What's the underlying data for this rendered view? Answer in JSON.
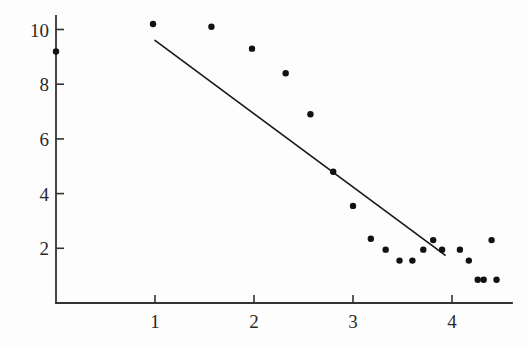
{
  "chart_data": {
    "type": "scatter",
    "title": "",
    "subtitle": "",
    "xlabel": "",
    "ylabel": "",
    "xlim": [
      -0.57,
      4.61
    ],
    "ylim": [
      0.0,
      11.1
    ],
    "grid": false,
    "legend": null,
    "x_ticks": [
      1,
      2,
      3,
      4
    ],
    "x_tick_labels": [
      "1",
      "2",
      "3",
      "4"
    ],
    "y_ticks": [
      2,
      4,
      6,
      8,
      10
    ],
    "y_tick_labels": [
      "2",
      "4",
      "6",
      "8",
      "10"
    ],
    "points": [
      {
        "x": 0.0,
        "y": 9.2
      },
      {
        "x": 0.98,
        "y": 10.2
      },
      {
        "x": 1.57,
        "y": 10.1
      },
      {
        "x": 1.98,
        "y": 9.3
      },
      {
        "x": 2.32,
        "y": 8.4
      },
      {
        "x": 2.57,
        "y": 6.9
      },
      {
        "x": 2.8,
        "y": 4.8
      },
      {
        "x": 3.0,
        "y": 3.55
      },
      {
        "x": 3.18,
        "y": 2.35
      },
      {
        "x": 3.33,
        "y": 1.95
      },
      {
        "x": 3.47,
        "y": 1.55
      },
      {
        "x": 3.6,
        "y": 1.55
      },
      {
        "x": 3.71,
        "y": 1.95
      },
      {
        "x": 3.81,
        "y": 2.3
      },
      {
        "x": 3.9,
        "y": 1.95
      },
      {
        "x": 4.08,
        "y": 1.95
      },
      {
        "x": 4.17,
        "y": 1.55
      },
      {
        "x": 4.26,
        "y": 0.85
      },
      {
        "x": 4.32,
        "y": 0.85
      },
      {
        "x": 4.4,
        "y": 2.3
      },
      {
        "x": 4.45,
        "y": 0.85
      }
    ],
    "fit_line": {
      "x_start": 1.0,
      "y_start": 9.6,
      "x_end": 3.93,
      "y_end": 1.75
    },
    "marker_style": "filled-circle",
    "marker_radius_px": 3.2,
    "colors": {
      "marker": "#111111",
      "line": "#1a1a1a",
      "axis": "#333333",
      "background": "#fdfdfd",
      "tick_text": "#2a2a2a"
    },
    "axes_geometry": {
      "origin_x_px": 56,
      "origin_y_px": 303,
      "x_px_per_unit": 99,
      "y_px_per_unit": 27.35,
      "x_axis_right_px": 512,
      "y_axis_top_px": 16,
      "tick_len_px": 8
    }
  }
}
